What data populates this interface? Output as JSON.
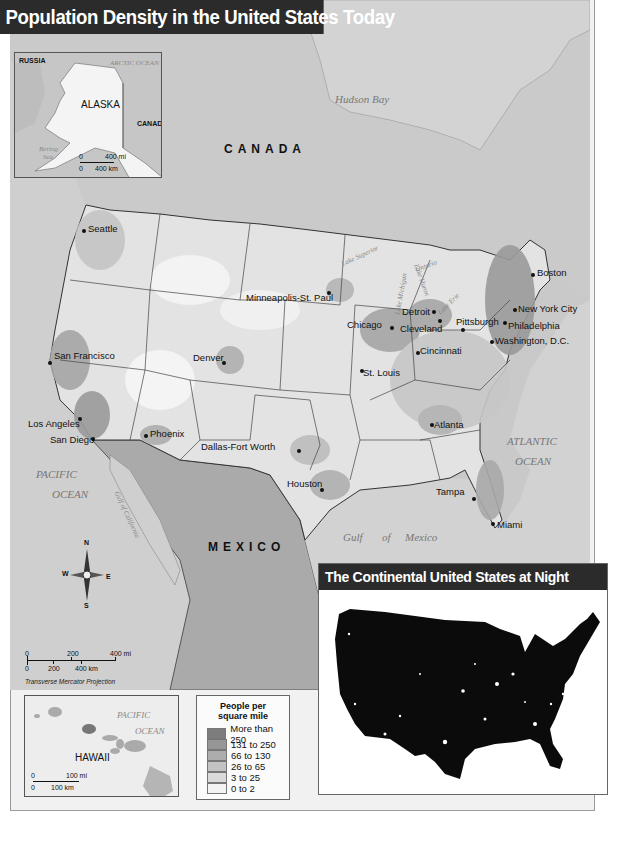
{
  "title": "Population Density in the United States Today",
  "map": {
    "countries": {
      "canada": "CANADA",
      "mexico": "MEXICO"
    },
    "water_bodies": {
      "hudson_bay": "Hudson Bay",
      "pacific": [
        "PACIFIC",
        "OCEAN"
      ],
      "atlantic": [
        "ATLANTIC",
        "OCEAN"
      ],
      "gulf_of_mexico": [
        "Gulf",
        "of",
        "Mexico"
      ],
      "gulf_of_california": "Gulf of California",
      "lake_superior": "Lake Superior",
      "lake_michigan": "Lake Michigan",
      "lake_huron": "Lake Huron",
      "lake_erie": "Lake Erie",
      "lake_ontario": "Ontario"
    },
    "cities": [
      {
        "name": "Seattle",
        "x": 84,
        "y": 230
      },
      {
        "name": "San Francisco",
        "x": 49,
        "y": 362
      },
      {
        "name": "Los Angeles",
        "x": 80,
        "y": 418
      },
      {
        "name": "San Diego",
        "x": 92,
        "y": 439
      },
      {
        "name": "Phoenix",
        "x": 146,
        "y": 435
      },
      {
        "name": "Denver",
        "x": 223,
        "y": 362
      },
      {
        "name": "Minneapolis-St. Paul",
        "x": 329,
        "y": 292
      },
      {
        "name": "Chicago",
        "x": 382,
        "y": 327
      },
      {
        "name": "Detroit",
        "x": 422,
        "y": 311
      },
      {
        "name": "Cleveland",
        "x": 440,
        "y": 320
      },
      {
        "name": "Pittsburgh",
        "x": 461,
        "y": 329
      },
      {
        "name": "Cincinnati",
        "x": 418,
        "y": 352
      },
      {
        "name": "St. Louis",
        "x": 362,
        "y": 370
      },
      {
        "name": "Dallas-Fort Worth",
        "x": 298,
        "y": 450
      },
      {
        "name": "Houston",
        "x": 322,
        "y": 489
      },
      {
        "name": "Atlanta",
        "x": 432,
        "y": 424
      },
      {
        "name": "Tampa",
        "x": 464,
        "y": 497
      },
      {
        "name": "Miami",
        "x": 492,
        "y": 523
      },
      {
        "name": "Boston",
        "x": 533,
        "y": 274
      },
      {
        "name": "New York City",
        "x": 514,
        "y": 309
      },
      {
        "name": "Philadelphia",
        "x": 504,
        "y": 322
      },
      {
        "name": "Washington, D.C.",
        "x": 491,
        "y": 341
      }
    ],
    "compass": {
      "n": "N",
      "s": "S",
      "e": "E",
      "w": "W"
    },
    "scale": {
      "mi_labels": [
        "0",
        "200",
        "400 mi"
      ],
      "km_labels": [
        "0",
        "200",
        "400 km"
      ]
    },
    "projection": "Transverse Mercator Projection"
  },
  "alaska_inset": {
    "title": "ALASKA",
    "russia": "RUSSIA",
    "canada": "CANADA",
    "arctic_ocean": "ARCTIC OCEAN",
    "bering_sea": [
      "Bering",
      "Sea"
    ],
    "scale": {
      "mi_labels": [
        "0",
        "400 mi"
      ],
      "km_labels": [
        "0",
        "400 km"
      ]
    }
  },
  "hawaii_inset": {
    "title": "HAWAII",
    "pacific_ocean": [
      "PACIFIC",
      "OCEAN"
    ],
    "scale": {
      "mi_labels": [
        "0",
        "100 mi"
      ],
      "km_labels": [
        "0",
        "100 km"
      ]
    }
  },
  "legend": {
    "title_line1": "People per",
    "title_line2": "square mile",
    "items": [
      {
        "label": "More than 250",
        "color": "#7d7d7d"
      },
      {
        "label": "131 to 250",
        "color": "#969696"
      },
      {
        "label": "66 to 130",
        "color": "#adadad"
      },
      {
        "label": "26 to 65",
        "color": "#c3c3c3"
      },
      {
        "label": "3 to 25",
        "color": "#dadada"
      },
      {
        "label": "0 to 2",
        "color": "#f3f3f3"
      }
    ]
  },
  "night_inset": {
    "title": "The Continental United States at Night"
  }
}
